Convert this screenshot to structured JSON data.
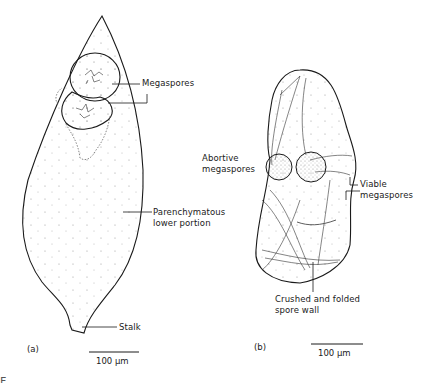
{
  "figure": {
    "panels": [
      {
        "id": "a",
        "panel_label": "(a)",
        "labels": {
          "megaspores": "Megaspores",
          "parenchymatous_line1": "Parenchymatous",
          "parenchymatous_line2": "lower portion",
          "stalk": "Stalk"
        },
        "scale_bar": "100 µm"
      },
      {
        "id": "b",
        "panel_label": "(b)",
        "labels": {
          "abortive_line1": "Abortive",
          "abortive_line2": "megaspores",
          "viable_line1": "Viable",
          "viable_line2": "megaspores",
          "crushed_line1": "Crushed and folded",
          "crushed_line2": "spore wall"
        },
        "scale_bar": "100 µm"
      }
    ],
    "caption_partial": "F  . . .  . . ."
  },
  "colors": {
    "ink": "#1a1a1a",
    "stipple": "#9a9a9a",
    "background": "#ffffff"
  }
}
